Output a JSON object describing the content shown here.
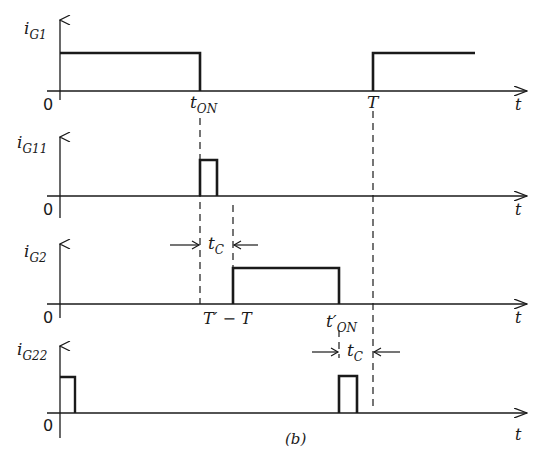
{
  "figure": {
    "caption": "(b)",
    "time_axis_label": "t",
    "origin_label": "0",
    "ink_color": "#1a1a1a",
    "background": "#ffffff"
  },
  "traces": [
    {
      "name": "iG1",
      "label_main": "i",
      "label_sub": "G1",
      "pulses": [
        [
          0,
          "t_ON"
        ],
        [
          "T",
          "beyond"
        ]
      ]
    },
    {
      "name": "iG11",
      "label_main": "i",
      "label_sub": "G11",
      "pulses": [
        [
          "t_ON",
          "t_ON + short"
        ]
      ]
    },
    {
      "name": "iG2",
      "label_main": "i",
      "label_sub": "G2",
      "pulses": [
        [
          "T' - T",
          "t'_ON"
        ]
      ]
    },
    {
      "name": "iG22",
      "label_main": "i",
      "label_sub": "G22",
      "pulses": [
        [
          0,
          "short"
        ],
        [
          "t'_ON",
          "t'_ON + short"
        ]
      ]
    }
  ],
  "annotations": {
    "t_on": {
      "main": "t",
      "sub": "ON"
    },
    "T": "T",
    "t_prime_minus_T": "T′ − T",
    "t_prime_on": {
      "main": "t′",
      "sub": "ON"
    },
    "t_c_1": {
      "main": "t",
      "sub": "C"
    },
    "t_c_2": {
      "main": "t",
      "sub": "C"
    }
  }
}
